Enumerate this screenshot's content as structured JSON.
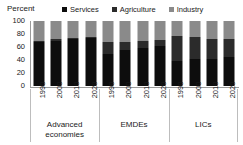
{
  "chart_data": {
    "type": "bar",
    "stacked": true,
    "title": "",
    "subtitle": "",
    "xlabel": "",
    "ylabel": "Percent",
    "ylim": [
      0,
      100
    ],
    "yticks": [
      0,
      20,
      40,
      60,
      80,
      100
    ],
    "grid": false,
    "legend_position": "top",
    "legend": [
      "Services",
      "Agriculture",
      "Industry"
    ],
    "colors": {
      "services": "#0d0d0d",
      "agriculture": "#2b2b2b",
      "industry": "#8a8a8a",
      "axis": "#9a9a9a",
      "separator": "#bdbdbd",
      "text": "#1a1a1a",
      "background": "#ffffff"
    },
    "categories": [
      "1990",
      "2000",
      "2010",
      "2020"
    ],
    "groups": [
      {
        "name": "Advanced economies",
        "label_line1": "Advanced",
        "label_line2": "economies",
        "bars": [
          {
            "x": "1990",
            "services": 67,
            "agriculture": 2,
            "industry": 31
          },
          {
            "x": "2000",
            "services": 70,
            "agriculture": 2,
            "industry": 28
          },
          {
            "x": "2010",
            "services": 73,
            "agriculture": 1,
            "industry": 26
          },
          {
            "x": "2020",
            "services": 74,
            "agriculture": 1,
            "industry": 25
          }
        ]
      },
      {
        "name": "EMDEs",
        "label_line1": "EMDEs",
        "label_line2": "",
        "bars": [
          {
            "x": "1990",
            "services": 50,
            "agriculture": 18,
            "industry": 32
          },
          {
            "x": "2000",
            "services": 55,
            "agriculture": 13,
            "industry": 32
          },
          {
            "x": "2010",
            "services": 58,
            "agriculture": 11,
            "industry": 31
          },
          {
            "x": "2020",
            "services": 61,
            "agriculture": 10,
            "industry": 29
          }
        ]
      },
      {
        "name": "LICs",
        "label_line1": "LICs",
        "label_line2": "",
        "bars": [
          {
            "x": "1990",
            "services": 39,
            "agriculture": 38,
            "industry": 23
          },
          {
            "x": "2000",
            "services": 41,
            "agriculture": 35,
            "industry": 24
          },
          {
            "x": "2010",
            "services": 42,
            "agriculture": 31,
            "industry": 27
          },
          {
            "x": "2020",
            "services": 45,
            "agriculture": 27,
            "industry": 28
          }
        ]
      }
    ]
  }
}
